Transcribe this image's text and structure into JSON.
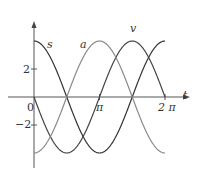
{
  "chart_data": {
    "type": "line",
    "title": "",
    "xlabel": "t",
    "ylabel": "",
    "xlim": [
      0,
      6.2832
    ],
    "ylim": [
      -4,
      4
    ],
    "grid": false,
    "x_ticks": [
      {
        "value": 0,
        "label": "0"
      },
      {
        "value": 3.1416,
        "label": "π"
      },
      {
        "value": 6.2832,
        "label": "2π"
      }
    ],
    "y_ticks": [
      {
        "value": 2,
        "label": "2"
      },
      {
        "value": -2,
        "label": "−2"
      }
    ],
    "series": [
      {
        "name": "s",
        "formula": "4cos(t)",
        "color": "#333333"
      },
      {
        "name": "v",
        "formula": "-4sin(t)",
        "color": "#444444"
      },
      {
        "name": "a",
        "formula": "-4cos(t)",
        "color": "#8a8a8a"
      }
    ]
  },
  "labels": {
    "s": "s",
    "a": "a",
    "v": "v",
    "t": "t",
    "zero": "0",
    "pi": "π",
    "two_pi": "2 π",
    "y2": "2",
    "yneg2": "−2"
  }
}
